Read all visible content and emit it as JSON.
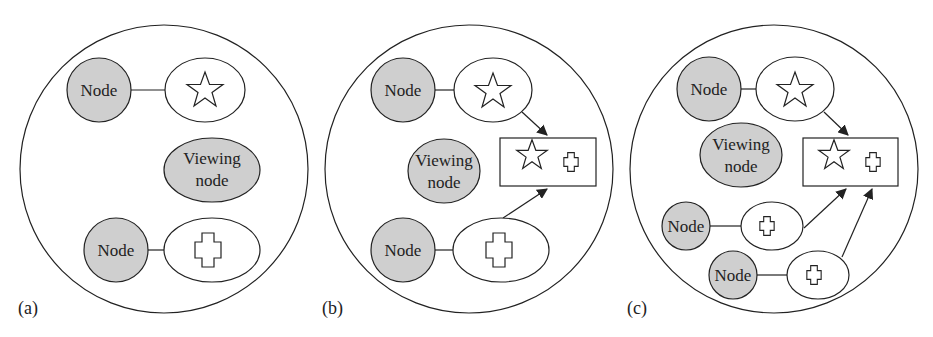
{
  "colors": {
    "node_fill": "#cfcfcf",
    "stroke": "#222222",
    "background": "#ffffff"
  },
  "panels": [
    {
      "id": "a",
      "label": "(a)",
      "nodes": [
        {
          "label": "Node",
          "object": "star"
        },
        {
          "label": "Node",
          "object": "cross"
        }
      ],
      "viewing_node": {
        "line1": "Viewing",
        "line2": "node"
      }
    },
    {
      "id": "b",
      "label": "(b)",
      "nodes": [
        {
          "label": "Node",
          "object": "star"
        },
        {
          "label": "Node",
          "object": "cross"
        }
      ],
      "viewing_node": {
        "line1": "Viewing",
        "line2": "node"
      },
      "composite": [
        "star",
        "cross"
      ]
    },
    {
      "id": "c",
      "label": "(c)",
      "nodes": [
        {
          "label": "Node",
          "object": "star"
        },
        {
          "label": "Node",
          "object": "small-cross"
        },
        {
          "label": "Node",
          "object": "small-cross"
        }
      ],
      "viewing_node": {
        "line1": "Viewing",
        "line2": "node"
      },
      "composite": [
        "star",
        "cross"
      ]
    }
  ]
}
